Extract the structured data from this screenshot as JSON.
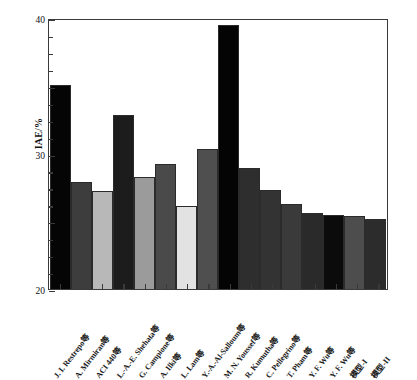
{
  "chart_data": {
    "type": "bar",
    "title": "",
    "xlabel": "",
    "ylabel": "IAE/%",
    "ylim": [
      0,
      40
    ],
    "ytick_labels": [
      "0",
      "10",
      "20",
      "30",
      "40"
    ],
    "ytick_values": [
      0,
      10,
      20,
      30,
      40
    ],
    "yminor_step": 2.5,
    "grid": false,
    "legend": "none",
    "categories": [
      "J. I. Restrepo等",
      "A. Mirmiran等",
      "ACI 440等",
      "L.-A.-E. Shehata等",
      "G. Campione等",
      "A. Ilki等",
      "L. Lam等",
      "Y.-A.-Al-Salloum等",
      "M. N. Youssef等",
      "R. Kumutha等",
      "C. Pellegrino等",
      "T. Pham等",
      "Y. F. Wu等",
      "Y. F. Wu等",
      "模型-I",
      "模型-II"
    ],
    "values": [
      30.1,
      15.8,
      14.5,
      25.7,
      16.5,
      18.4,
      12.3,
      20.7,
      39.0,
      17.8,
      14.6,
      12.5,
      11.2,
      10.9,
      10.8,
      10.4
    ],
    "bar_colors": [
      "#050505",
      "#3d3d3d",
      "#b8b8b8",
      "#1c1c1c",
      "#9b9b9b",
      "#4a4a4a",
      "#e2e2e2",
      "#4f4f4f",
      "#040404",
      "#2e2e2e",
      "#333333",
      "#3a3a3a",
      "#2a2a2a",
      "#0b0b0b",
      "#4d4d4d",
      "#2c2c2c"
    ]
  },
  "axes": {
    "frame_color": "#3a3a3a",
    "background": "#ffffff"
  }
}
